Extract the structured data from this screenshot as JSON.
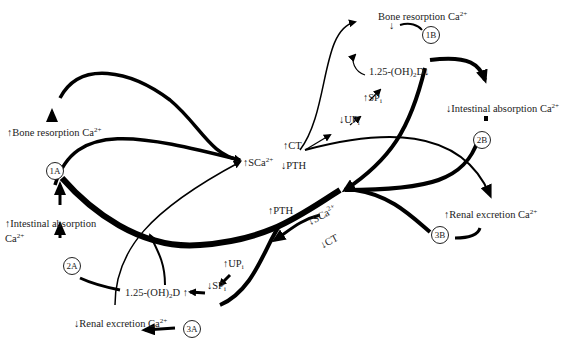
{
  "diagram": {
    "title": "",
    "center_labels": {
      "high_serum_ca": "↑SCa",
      "high_serum_ca_sup": "2+",
      "low_serum_ca": "↓SCa",
      "low_serum_ca_sup": "2+",
      "ct_up_top": "↑CT",
      "pth_down_top": "↓PTH",
      "pth_up_bottom": "↑PTH",
      "ct_down_bottom": "↓CT"
    },
    "upper_pathway": {
      "up_i_down": "↓UP",
      "up_i_down_sub": "i",
      "sp_i_up": "↑SP",
      "sp_i_up_sub": "i",
      "vitd_down": "1.25-(OH)",
      "vitd_down_sub": "2",
      "vitd_down_tail": "D↓"
    },
    "lower_pathway": {
      "up_i_up": "↑UP",
      "up_i_up_sub": "i",
      "sp_i_down": "↓SP",
      "sp_i_down_sub": "i",
      "vitd_up": "1.25-(OH)",
      "vitd_up_sub": "2",
      "vitd_up_tail": "D ↑"
    },
    "effects_A": {
      "bone_resorption_up": "↑Bone resorption Ca",
      "bone_resorption_up_sup": "2+",
      "intestinal_absorption_up_line1": "↑Intestinal absorption",
      "intestinal_absorption_up_line2": "Ca",
      "intestinal_absorption_up_sup": "2+",
      "renal_excretion_down": "↓Renal excretion Ca",
      "renal_excretion_down_sup": "2+"
    },
    "effects_B": {
      "bone_resorption_down_line1": "Bone resorption Ca",
      "bone_resorption_down_sup": "2+",
      "bone_resorption_down_arrow": "↓",
      "intestinal_absorption_down": "↓Intestinal absorption Ca",
      "intestinal_absorption_down_sup": "2+",
      "renal_excretion_up": "↑Renal excretion Ca",
      "renal_excretion_up_sup": "2+"
    },
    "nodes": {
      "n1A": "1A",
      "n2A": "2A",
      "n3A": "3A",
      "n1B": "1B",
      "n2B": "2B",
      "n3B": "3B"
    },
    "colors": {
      "stroke": "#000000",
      "text": "#222222",
      "background": "#ffffff"
    }
  }
}
